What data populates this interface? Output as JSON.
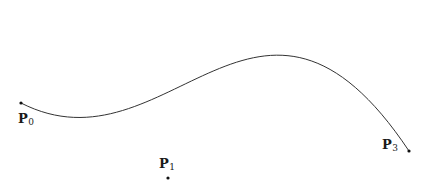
{
  "figure": {
    "type": "cubic-bezier-curve",
    "curve_color": "#333333",
    "point_color": "#111111",
    "points": [
      {
        "id": "P0",
        "label": "P",
        "subscript": "0",
        "x": 21,
        "y": 103,
        "label_x": 18,
        "label_y": 123,
        "visible": true
      },
      {
        "id": "P1",
        "label": "P",
        "subscript": "1",
        "x": 168,
        "y": 178,
        "label_x": 159,
        "label_y": 168,
        "visible": true
      },
      {
        "id": "P3",
        "label": "P",
        "subscript": "3",
        "x": 409,
        "y": 151,
        "label_x": 382,
        "label_y": 149,
        "visible": true
      }
    ],
    "hidden_control_point": {
      "id": "P2",
      "x": 259,
      "y": -74
    }
  }
}
